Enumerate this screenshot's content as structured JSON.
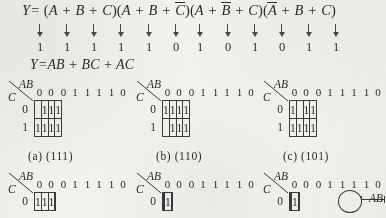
{
  "equations": {
    "pos": {
      "lhs": "Y=",
      "factors": [
        {
          "open": "(",
          "terms": [
            "A",
            "B",
            "C"
          ],
          "bars": [
            false,
            false,
            false
          ],
          "close": ")"
        },
        {
          "open": "(",
          "terms": [
            "A",
            "B",
            "C"
          ],
          "bars": [
            false,
            false,
            true
          ],
          "close": ")"
        },
        {
          "open": "(",
          "terms": [
            "A",
            "B",
            "C"
          ],
          "bars": [
            false,
            true,
            false
          ],
          "close": ")"
        },
        {
          "open": "(",
          "terms": [
            "A",
            "B",
            "C"
          ],
          "bars": [
            true,
            false,
            false
          ],
          "close": ")"
        }
      ],
      "plus": "+"
    },
    "sop": {
      "text": "Y=AB + BC + AC"
    }
  },
  "annotation": {
    "arrow_count": 12,
    "bits": [
      "1",
      "1",
      "1",
      "1",
      "1",
      "0",
      "1",
      "0",
      "1",
      "0",
      "1",
      "1"
    ]
  },
  "kmap_common": {
    "label_ab": "AB",
    "label_c": "C",
    "col_headers": [
      "0 0",
      "0 1",
      "1 1",
      "1 0"
    ],
    "row_headers": [
      "0",
      "1"
    ]
  },
  "kmaps_top": [
    {
      "caption": "(a)  (111)",
      "rows": [
        [
          "",
          "1",
          "1",
          "1"
        ],
        [
          "1",
          "1",
          "1",
          "1"
        ]
      ]
    },
    {
      "caption": "(b)  (110)",
      "rows": [
        [
          "1",
          "1",
          "1",
          "1"
        ],
        [
          "",
          "1",
          "1",
          "1"
        ]
      ]
    },
    {
      "caption": "(c)  (101)",
      "rows": [
        [
          "1",
          "",
          "1",
          "1"
        ],
        [
          "1",
          "1",
          "1",
          "1"
        ]
      ]
    }
  ],
  "kmaps_bottom": [
    {
      "rows": [
        [
          "1",
          "1",
          "1",
          ""
        ]
      ],
      "loop": null
    },
    {
      "rows": [
        [
          "",
          "",
          "1",
          ""
        ]
      ],
      "loop": null
    },
    {
      "rows": [
        [
          "",
          "",
          "1",
          ""
        ]
      ],
      "loop": {
        "col": 2,
        "label": "AB"
      }
    }
  ]
}
